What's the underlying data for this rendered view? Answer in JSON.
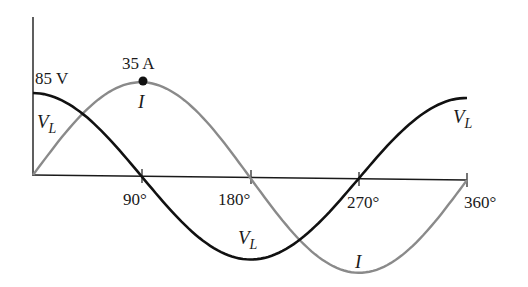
{
  "chart_data": {
    "type": "line",
    "title": "",
    "xlabel": "",
    "ylabel": "",
    "x_ticks": [
      "90°",
      "180°",
      "270°",
      "360°"
    ],
    "x_tick_values": [
      90,
      180,
      270,
      360
    ],
    "xlim": [
      0,
      360
    ],
    "series": [
      {
        "name": "V_L",
        "label": "V",
        "subscript": "L",
        "color": "#111111",
        "function": "85*cos(theta)",
        "amplitude": 85,
        "unit": "V",
        "x": [
          0,
          45,
          90,
          135,
          180,
          225,
          270,
          315,
          360
        ],
        "values": [
          85,
          60.1,
          0,
          -60.1,
          -85,
          -60.1,
          0,
          60.1,
          85
        ]
      },
      {
        "name": "I",
        "label": "I",
        "color": "#8a8a8a",
        "function": "35*sin(theta)",
        "amplitude": 35,
        "unit": "A",
        "x": [
          0,
          45,
          90,
          135,
          180,
          225,
          270,
          315,
          360
        ],
        "values": [
          0,
          24.7,
          35,
          24.7,
          0,
          -24.7,
          -35,
          -24.7,
          0
        ]
      }
    ],
    "annotations": [
      {
        "text": "85 V",
        "at": [
          0,
          85
        ]
      },
      {
        "text": "35 A",
        "at": [
          90,
          35
        ],
        "marker": "dot"
      }
    ]
  },
  "labels": {
    "vl_peak": "85 V",
    "i_peak": "35 A",
    "vl_symbol": "V",
    "vl_sub": "L",
    "i_symbol": "I",
    "tick_90": "90°",
    "tick_180": "180°",
    "tick_270": "270°",
    "tick_360": "360°"
  },
  "colors": {
    "voltage": "#111111",
    "current": "#8a8a8a",
    "axis": "#1a1a1a"
  }
}
